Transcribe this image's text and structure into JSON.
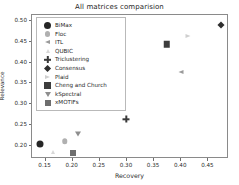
{
  "chart_data": {
    "type": "scatter",
    "title": "All matrices comparision",
    "xlabel": "Recovery",
    "ylabel": "Relevance",
    "xlim": [
      0.125,
      0.488
    ],
    "ylim": [
      0.168,
      0.515
    ],
    "grid": false,
    "legend_position": "upper left",
    "xticks": [
      "0.15",
      "0.20",
      "0.25",
      "0.30",
      "0.35",
      "0.40",
      "0.45"
    ],
    "xtick_values": [
      0.15,
      0.2,
      0.25,
      0.3,
      0.35,
      0.4,
      0.45
    ],
    "yticks": [
      "0.20",
      "0.25",
      "0.30",
      "0.35",
      "0.40",
      "0.45",
      "0.50"
    ],
    "ytick_values": [
      0.2,
      0.25,
      0.3,
      0.35,
      0.4,
      0.45,
      0.5
    ],
    "series": [
      {
        "name": "BiMax",
        "x": 0.139,
        "y": 0.203,
        "marker": "circle",
        "color": "#262626",
        "size": 7.0
      },
      {
        "name": "Floc",
        "x": 0.185,
        "y": 0.211,
        "marker": "circle",
        "color": "#b0b0b0",
        "size": 5.5
      },
      {
        "name": "ITL",
        "x": 0.4,
        "y": 0.378,
        "marker": "triangle-left",
        "color": "#9a9a9a",
        "size": 5.0
      },
      {
        "name": "QUBIC",
        "x": 0.163,
        "y": 0.186,
        "marker": "triangle-up",
        "color": "#d8d8d8",
        "size": 4.5
      },
      {
        "name": "Triclustering",
        "x": 0.299,
        "y": 0.264,
        "marker": "plus",
        "color": "#3a3a3a",
        "size": 7.0
      },
      {
        "name": "Consensus",
        "x": 0.474,
        "y": 0.492,
        "marker": "diamond",
        "color": "#2e2e2e",
        "size": 6.5
      },
      {
        "name": "Plaid",
        "x": 0.413,
        "y": 0.464,
        "marker": "triangle-right",
        "color": "#cfcfcf",
        "size": 5.0
      },
      {
        "name": "Cheng and Church",
        "x": 0.373,
        "y": 0.444,
        "marker": "square",
        "color": "#3d3d3d",
        "size": 6.5
      },
      {
        "name": "kSpectral",
        "x": 0.21,
        "y": 0.229,
        "marker": "triangle-down",
        "color": "#8e8e8e",
        "size": 5.5
      },
      {
        "name": "xMOTIFs",
        "x": 0.2,
        "y": 0.182,
        "marker": "square",
        "color": "#6e6e6e",
        "size": 6.0
      }
    ]
  },
  "legend": {
    "items": [
      {
        "label": "BiMax"
      },
      {
        "label": "Floc"
      },
      {
        "label": "ITL"
      },
      {
        "label": "QUBIC"
      },
      {
        "label": "Triclustering"
      },
      {
        "label": "Consensus"
      },
      {
        "label": "Plaid"
      },
      {
        "label": "Cheng and Church"
      },
      {
        "label": "kSpectral"
      },
      {
        "label": "xMOTIFs"
      }
    ]
  }
}
